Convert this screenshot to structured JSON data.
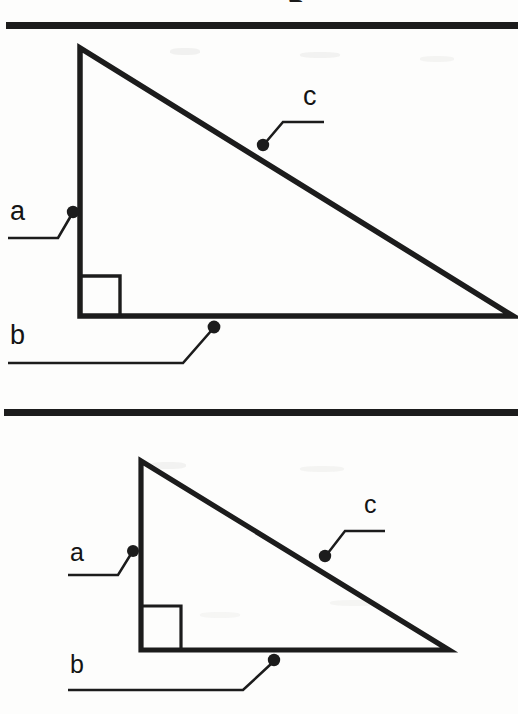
{
  "document": {
    "kind": "scanned-textbook-diagram",
    "background_color": "#fdfdfc",
    "ink_color": "#1c1c1c",
    "page_width": 518,
    "page_height": 714,
    "cropped_heading_fragment": "g"
  },
  "rules": [
    {
      "name": "top-rule",
      "x": 6,
      "y": 22,
      "width": 512,
      "height": 7
    },
    {
      "name": "middle-rule",
      "x": 4,
      "y": 409,
      "width": 514,
      "height": 7
    }
  ],
  "figures": [
    {
      "name": "right-triangle-upper",
      "stroke_width": 5,
      "vertices": {
        "apex": [
          80,
          48
        ],
        "right_angle": [
          80,
          316
        ],
        "right_vertex": [
          513,
          316
        ]
      },
      "right_angle_marker": {
        "x": 80,
        "y": 276,
        "size": 40
      },
      "labels": [
        {
          "id": "a",
          "text": "a",
          "text_x": 10,
          "text_y": 198,
          "leader": {
            "h_from": 8,
            "h_to": 58,
            "h_y": 238,
            "dot": [
              74,
              212
            ]
          }
        },
        {
          "id": "b",
          "text": "b",
          "text_x": 10,
          "text_y": 322,
          "leader": {
            "h_from": 8,
            "h_to": 183,
            "h_y": 363,
            "dot": [
              214,
              327
            ]
          }
        },
        {
          "id": "c",
          "text": "c",
          "text_x": 303,
          "text_y": 83,
          "leader": {
            "h_from": 283,
            "h_to": 324,
            "h_y": 122,
            "dot": [
              262,
              145
            ]
          }
        }
      ]
    },
    {
      "name": "right-triangle-lower",
      "stroke_width": 5,
      "vertices": {
        "apex": [
          141,
          461
        ],
        "right_angle": [
          141,
          650
        ],
        "right_vertex": [
          449,
          650
        ]
      },
      "right_angle_marker": {
        "x": 141,
        "y": 606,
        "size": 40
      },
      "labels": [
        {
          "id": "a",
          "text": "a",
          "text_x": 70,
          "text_y": 540,
          "leader": {
            "h_from": 68,
            "h_to": 118,
            "h_y": 575,
            "dot": [
              133,
              552
            ]
          }
        },
        {
          "id": "b",
          "text": "b",
          "text_x": 70,
          "text_y": 652,
          "leader": {
            "h_from": 68,
            "h_to": 243,
            "h_y": 690,
            "dot": [
              274,
              660
            ]
          }
        },
        {
          "id": "c",
          "text": "c",
          "text_x": 364,
          "text_y": 492,
          "leader": {
            "h_from": 345,
            "h_to": 385,
            "h_y": 531,
            "dot": [
              324,
              556
            ]
          }
        }
      ]
    }
  ]
}
